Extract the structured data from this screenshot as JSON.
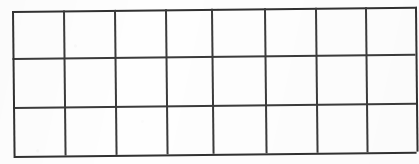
{
  "document": {
    "title": "Blank Grid Table",
    "kind": "hand-drawn-grid",
    "medium": "scanned paper",
    "background_color": "#fefefe",
    "line_color": "#3b3b3b",
    "border_color": "#313131"
  },
  "grid": {
    "columns": 8,
    "rows": 3,
    "total_cells": 24,
    "rotation_degrees": -0.62,
    "bounds": {
      "left": 12,
      "top": 11,
      "width": 403,
      "height": 145
    },
    "column_x": [
      0,
      51,
      102,
      153,
      199,
      252,
      303,
      353,
      403
    ],
    "row_y": [
      0,
      47,
      96,
      145
    ],
    "column_labels": [
      "1",
      "2",
      "3",
      "4",
      "5",
      "6",
      "7",
      "8"
    ],
    "row_labels": [
      "1",
      "2",
      "3"
    ],
    "cells": [
      [
        "",
        "",
        "",
        "",
        "",
        "",
        "",
        ""
      ],
      [
        "",
        "",
        "",
        "",
        "",
        "",
        "",
        ""
      ],
      [
        "",
        "",
        "",
        "",
        "",
        "",
        "",
        ""
      ]
    ]
  }
}
